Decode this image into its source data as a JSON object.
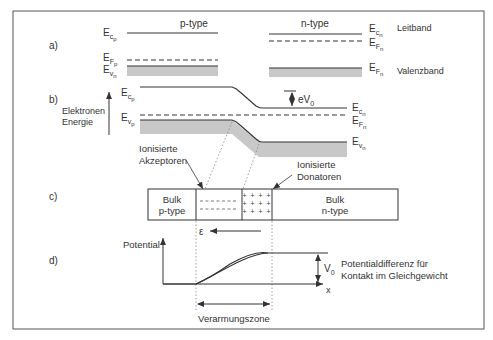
{
  "section_labels": {
    "a": "a)",
    "b": "b)",
    "c": "c)",
    "d": "d)"
  },
  "panel_a": {
    "p_type_title": "p-type",
    "n_type_title": "n-type",
    "p": {
      "Ec": "E",
      "Ec_sub": "c",
      "Ec_subsub": "p",
      "Ef": "E",
      "Ef_sub": "F",
      "Ef_subsub": "p",
      "Ev": "E",
      "Ev_sub": "v",
      "Ev_subsub": "n"
    },
    "n": {
      "Ec": "E",
      "Ec_sub": "c",
      "Ec_subsub": "n",
      "Ef": "E",
      "Ef_sub": "F",
      "Ef_subsub": "n",
      "Ev": "E",
      "Ev_sub": "F",
      "Ev_subsub": "n"
    },
    "leitband": "Leitband",
    "valenzband": "Valenzband"
  },
  "panel_b": {
    "axis_label_1": "Elektronen",
    "axis_label_2": "Energie",
    "Ecp": "E",
    "Ecp_sub": "c",
    "Ecp_subsub": "p",
    "Evp": "E",
    "Evp_sub": "v",
    "Evp_subsub": "p",
    "Ecn": "E",
    "Ecn_sub": "c",
    "Ecn_subsub": "n",
    "Efn": "E",
    "Efn_sub": "F",
    "Efn_subsub": "n",
    "Evn": "E",
    "Evn_sub": "v",
    "Evn_subsub": "n",
    "eV0": "eV",
    "eV0_sub": "0",
    "akzeptoren_1": "Ionisierte",
    "akzeptoren_2": "Akzeptoren",
    "donatoren_1": "Ionisierte",
    "donatoren_2": "Donatoren"
  },
  "panel_c": {
    "bulk_p_1": "Bulk",
    "bulk_p_2": "p-type",
    "bulk_n_1": "Bulk",
    "bulk_n_2": "n-type",
    "neg_row": "– – – – – –",
    "pos_row": "+ + + +",
    "field_symbol": "ε"
  },
  "panel_d": {
    "y_label": "Potential",
    "x_label": "x",
    "V0": "V",
    "V0_sub": "0",
    "desc_1": "Potentialdifferenz für",
    "desc_2": "Kontakt im Gleichgewicht",
    "zone_label": "Verarmungszone"
  },
  "colors": {
    "line": "#333333",
    "band_fill": "#c8c8c8",
    "frame": "#555555",
    "dotted": "#777777"
  }
}
